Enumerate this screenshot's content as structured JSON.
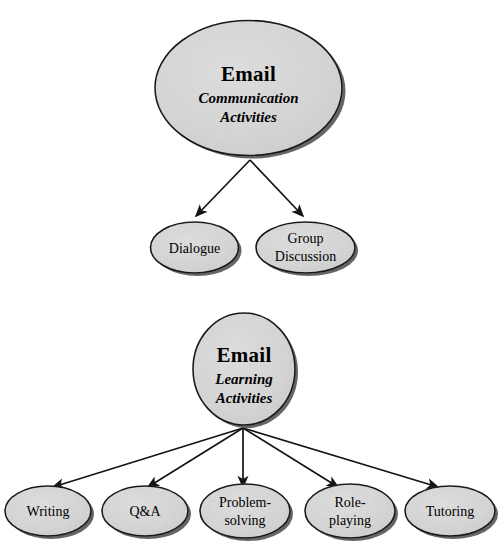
{
  "diagram": {
    "background_color": "#ffffff",
    "node_fill_color": "#d8d8d8",
    "node_stroke_color": "#1a1a1a",
    "shadow_color": "#4a4a4a",
    "edge_color": "#141414",
    "arrow_style": "solid-filled-triangle"
  },
  "branches": [
    {
      "id": "communication",
      "root": {
        "title": "Email",
        "subtitle_line1": "Communication",
        "subtitle_line2": "Activities"
      },
      "children": [
        {
          "id": "dialogue",
          "line1": "Dialogue",
          "line2": ""
        },
        {
          "id": "group-discussion",
          "line1": "Group",
          "line2": "Discussion"
        }
      ]
    },
    {
      "id": "learning",
      "root": {
        "title": "Email",
        "subtitle_line1": "Learning",
        "subtitle_line2": "Activities"
      },
      "children": [
        {
          "id": "writing",
          "line1": "Writing",
          "line2": ""
        },
        {
          "id": "qanda",
          "line1": "Q&A",
          "line2": ""
        },
        {
          "id": "problem-solving",
          "line1": "Problem-",
          "line2": "solving"
        },
        {
          "id": "role-playing",
          "line1": "Role-",
          "line2": "playing"
        },
        {
          "id": "tutoring",
          "line1": "Tutoring",
          "line2": ""
        }
      ]
    }
  ]
}
